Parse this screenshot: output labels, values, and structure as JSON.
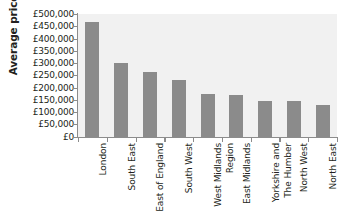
{
  "chart_data": {
    "type": "bar",
    "title": "",
    "xlabel": "",
    "ylabel": "Average price",
    "ylim": [
      0,
      500000
    ],
    "ytick_step": 50000,
    "grid": false,
    "legend": "none",
    "bar_color": "#8b8b8b",
    "plot_background": "#f1f1f1",
    "axis_color": "#8c8c8c",
    "currency_symbol": "£",
    "categories": [
      "London",
      "South East",
      "East of England",
      "South West",
      "West Midlands\nRegion",
      "East Midlands",
      "Yorkshire and\nThe Humber",
      "North West",
      "North East"
    ],
    "values": [
      467000,
      301000,
      264000,
      232000,
      174000,
      170000,
      146000,
      146000,
      129000
    ],
    "ytick_labels": [
      "£500,000",
      "£450,000",
      "£400,000",
      "£350,000",
      "£300,000",
      "£250,000",
      "£200,000",
      "£150,000",
      "£100,000",
      "£50,000",
      "£0"
    ],
    "ytick_values": [
      500000,
      450000,
      400000,
      350000,
      300000,
      250000,
      200000,
      150000,
      100000,
      50000,
      0
    ]
  }
}
